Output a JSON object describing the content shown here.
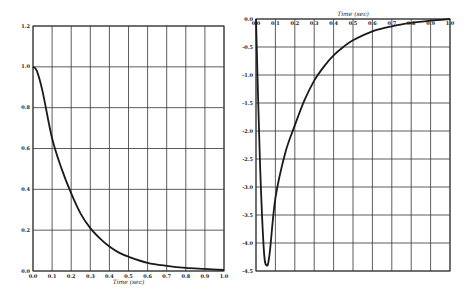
{
  "chart_data": [
    {
      "type": "line",
      "title": "",
      "xlabel": "Time (sec)",
      "ylabel": "",
      "xlim": [
        0.0,
        1.0
      ],
      "ylim": [
        0.0,
        1.2
      ],
      "grid": true,
      "xaxis_position": "bottom",
      "x_ticks": [
        "0.0",
        "0.1",
        "0.2",
        "0.3",
        "0.4",
        "0.5",
        "0.6",
        "0.7",
        "0.8",
        "0.9",
        "1.0"
      ],
      "y_ticks": [
        "0.0",
        "0.2",
        "0.4",
        "0.6",
        "0.8",
        "1.0",
        "1.2"
      ],
      "series": [
        {
          "name": "response",
          "x": [
            0.0,
            0.02,
            0.05,
            0.1,
            0.15,
            0.2,
            0.25,
            0.3,
            0.35,
            0.4,
            0.45,
            0.5,
            0.6,
            0.7,
            0.8,
            0.9,
            1.0
          ],
          "y": [
            1.0,
            0.98,
            0.88,
            0.65,
            0.5,
            0.38,
            0.28,
            0.21,
            0.16,
            0.12,
            0.09,
            0.07,
            0.04,
            0.025,
            0.015,
            0.01,
            0.005
          ]
        }
      ]
    },
    {
      "type": "line",
      "title": "",
      "xlabel": "Time (sec)",
      "ylabel": "",
      "xlim": [
        0.0,
        1.0
      ],
      "ylim": [
        -4.5,
        0.0
      ],
      "grid": true,
      "xaxis_position": "top",
      "x_ticks": [
        "0.0",
        "0.1",
        "0.2",
        "0.3",
        "0.4",
        "0.5",
        "0.6",
        "0.7",
        "0.8",
        "0.9",
        "1.0"
      ],
      "y_ticks": [
        "0.0",
        "-0.5",
        "-1.0",
        "-1.5",
        "-2.0",
        "-2.5",
        "-3.0",
        "-3.5",
        "-4.0",
        "-4.5"
      ],
      "series": [
        {
          "name": "derivative",
          "x": [
            0.0,
            0.02,
            0.04,
            0.055,
            0.07,
            0.1,
            0.15,
            0.2,
            0.25,
            0.3,
            0.35,
            0.4,
            0.45,
            0.5,
            0.6,
            0.7,
            0.8,
            0.9,
            1.0
          ],
          "y": [
            0.0,
            -2.5,
            -4.1,
            -4.4,
            -4.2,
            -3.2,
            -2.4,
            -1.9,
            -1.45,
            -1.1,
            -0.85,
            -0.65,
            -0.5,
            -0.38,
            -0.22,
            -0.13,
            -0.07,
            -0.03,
            0.0
          ]
        }
      ]
    }
  ]
}
